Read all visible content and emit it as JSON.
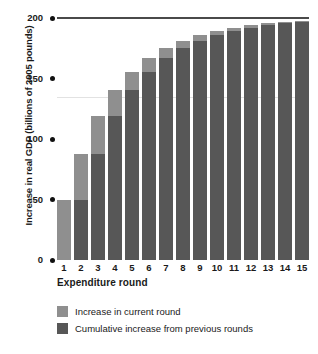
{
  "chart_data": {
    "type": "bar",
    "title": "",
    "xlabel": "Expenditure round",
    "ylabel": "Increase in real GDP (billions of 2005 pounds)",
    "categories": [
      "1",
      "2",
      "3",
      "4",
      "5",
      "6",
      "7",
      "8",
      "9",
      "10",
      "11",
      "12",
      "13",
      "14",
      "15"
    ],
    "ylim": [
      0,
      200
    ],
    "yticks": [
      0,
      50,
      100,
      150,
      200
    ],
    "ytick_labels": [
      "0",
      "50",
      "100",
      "150",
      "200"
    ],
    "grid": false,
    "stacked": true,
    "legend_position": "bottom-left",
    "series": [
      {
        "name": "Cumulative increase from previous rounds",
        "color": "#575757",
        "values": [
          0,
          50,
          87.5,
          118.75,
          140.63,
          155.47,
          166.6,
          175,
          181.25,
          185.94,
          189.45,
          192.09,
          194.07,
          195.55,
          196.66
        ]
      },
      {
        "name": "Increase in current round",
        "color": "#8f8f8f",
        "values": [
          50,
          37.5,
          31.25,
          21.88,
          14.84,
          11.13,
          8.4,
          6.25,
          4.69,
          3.51,
          2.64,
          1.98,
          1.48,
          1.11,
          0.84
        ]
      }
    ],
    "totals": [
      50,
      87.5,
      118.75,
      140.63,
      155.47,
      166.6,
      175,
      181.25,
      185.94,
      189.45,
      192.09,
      194.07,
      195.55,
      196.66,
      197.5
    ]
  },
  "axes": {
    "y_title": "Increase in real GDP (billions of 2005 pounds)",
    "x_title": "Expenditure round",
    "y_ticks": [
      {
        "label": "200",
        "value": 200
      },
      {
        "label": "150",
        "value": 150
      },
      {
        "label": "100",
        "value": 100
      },
      {
        "label": "50",
        "value": 50
      },
      {
        "label": "0",
        "value": 0
      }
    ],
    "x_ticks": [
      "1",
      "2",
      "3",
      "4",
      "5",
      "6",
      "7",
      "8",
      "9",
      "10",
      "11",
      "12",
      "13",
      "14",
      "15"
    ]
  },
  "legend": {
    "items": [
      {
        "label": "Increase in current round",
        "color": "#8f8f8f"
      },
      {
        "label": "Cumulative increase from previous rounds",
        "color": "#575757"
      }
    ]
  },
  "colors": {
    "current_round": "#8f8f8f",
    "previous_rounds": "#575757",
    "top_rule": "#4a4a4a",
    "faint_rule": "#e2e2e2",
    "text": "#1a1a1a"
  }
}
